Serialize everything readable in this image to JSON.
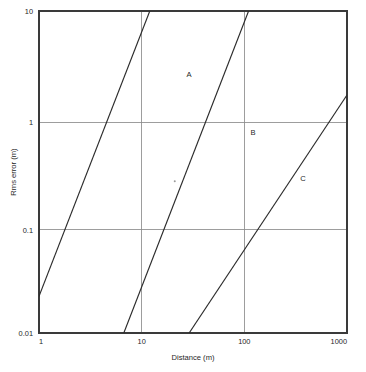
{
  "chart_data": {
    "type": "line",
    "title": "",
    "subtitle": "",
    "xlabel": "Distance (m)",
    "ylabel": "Rms error (m)",
    "xscale": "log",
    "yscale": "log",
    "xlim": [
      1,
      1000
    ],
    "ylim": [
      0.01,
      10
    ],
    "xticks": [
      "1",
      "10",
      "100",
      "1000"
    ],
    "xtick_values": [
      1,
      10,
      100,
      1000
    ],
    "yticks": [
      "0.01",
      "0.1",
      "1",
      "10"
    ],
    "ytick_values": [
      0.01,
      0.1,
      1,
      10
    ],
    "grid": true,
    "grid_axes": "both",
    "legend": "inline-labels",
    "series": [
      {
        "name": "A",
        "label": "A",
        "x": [
          1,
          12.0
        ],
        "y": [
          0.022,
          10
        ],
        "label_point": [
          22,
          3.0
        ],
        "description": "Leftmost line; rises from Rms error 0.022 m at 1 m to 10 m at about 12 m distance"
      },
      {
        "name": "B",
        "label": "B",
        "x": [
          6.7,
          110
        ],
        "y": [
          0.01,
          10
        ],
        "label_point": [
          120,
          0.78
        ],
        "description": "Middle line; rises from Rms error 0.01 m at about 6.7 m to 10 m at about 110 m distance"
      },
      {
        "name": "C",
        "label": "C",
        "x": [
          29,
          1000
        ],
        "y": [
          0.01,
          1.65
        ],
        "label_point": [
          370,
          0.3
        ],
        "description": "Rightmost line; rises from Rms error 0.01 m at about 29 m to 1.65 m at 1000 m distance"
      }
    ],
    "annotations": [
      {
        "name": "speck",
        "x": 21,
        "y": 0.26,
        "text": ""
      }
    ]
  },
  "axes": {
    "x_title": "Distance (m)",
    "y_title": "Rms error (m)"
  },
  "labels": {
    "a": "A",
    "b": "B",
    "c": "C"
  },
  "xticks": {
    "t0": "1",
    "t1": "10",
    "t2": "100",
    "t3": "1000"
  },
  "yticks": {
    "t0": "0.01",
    "t1": "0.1",
    "t2": "1",
    "t3": "10"
  },
  "colors": {
    "background": "#ffffff",
    "axis": "#3a3a3a",
    "grid": "#8c8c8c",
    "data_line": "#2b2b2b",
    "text": "#1f1f1f"
  }
}
